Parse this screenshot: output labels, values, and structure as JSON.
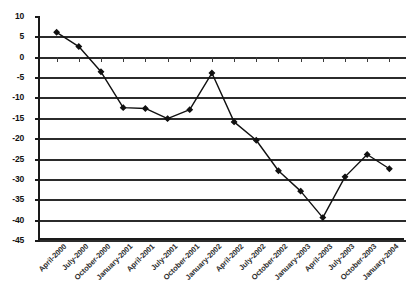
{
  "chart_data": {
    "type": "line",
    "title": "",
    "subtitle": "",
    "xlabel": "",
    "ylabel": "",
    "ylim": [
      -45,
      10
    ],
    "ytick_step": 5,
    "grid": true,
    "legend": false,
    "marker": "filled-diamond",
    "line_color": "#111111",
    "grid_color": "#2b2b2b",
    "axis_color": "#1a1a1a",
    "categories": [
      "April-2000",
      "July-2000",
      "October-2000",
      "January-2001",
      "April-2001",
      "July-2001",
      "October-2001",
      "January-2002",
      "April-2002",
      "July-2002",
      "October-2002",
      "January-2003",
      "April-2003",
      "July-2003",
      "October-2003",
      "January-2004"
    ],
    "values": [
      6.0,
      2.5,
      -3.7,
      -12.5,
      -12.7,
      -15.2,
      -13.0,
      -4.0,
      -16.0,
      -20.5,
      -28.0,
      -33.0,
      -39.5,
      -29.5,
      -24.0,
      -27.5
    ],
    "yticks": [
      10,
      5,
      0,
      -5,
      -10,
      -15,
      -20,
      -25,
      -30,
      -35,
      -40,
      -45
    ],
    "ytick_labels": [
      "10",
      "5",
      "0",
      "-5",
      "-10",
      "-15",
      "-20",
      "-25",
      "-30",
      "-35",
      "-40",
      "-45"
    ]
  }
}
